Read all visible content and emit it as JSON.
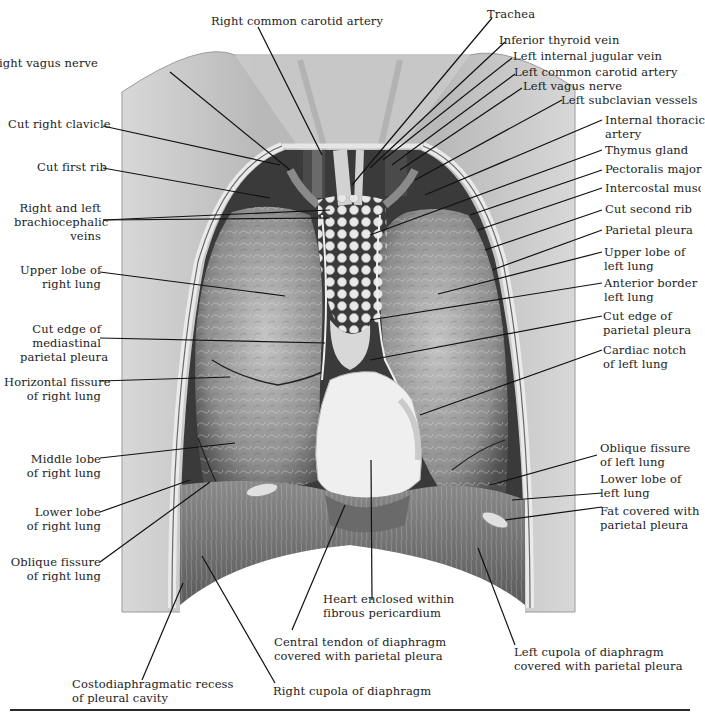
{
  "figure": {
    "style": "grayscale anatomical illustration"
  },
  "labels": {
    "right_common_carotid_artery": [
      "Right common carotid artery"
    ],
    "trachea": [
      "Trachea"
    ],
    "inferior_thyroid_vein": [
      "Inferior thyroid vein"
    ],
    "left_internal_jugular_vein": [
      "Left internal jugular vein"
    ],
    "left_common_carotid_artery": [
      "Left common carotid artery"
    ],
    "left_vagus_nerve": [
      "Left vagus nerve"
    ],
    "left_subclavian_vessels": [
      "Left subclavian vessels"
    ],
    "right_vagus_nerve": [
      "Right vagus nerve"
    ],
    "cut_right_clavicle": [
      "Cut right clavicle"
    ],
    "internal_thoracic_artery": [
      "Internal thoracic",
      "artery"
    ],
    "thymus_gland": [
      "Thymus gland"
    ],
    "cut_first_rib": [
      "Cut first rib"
    ],
    "pectoralis_major": [
      "Pectoralis major"
    ],
    "intercostal_muscle": [
      "Intercostal muscle"
    ],
    "brachiocephalic_veins": [
      "Right and left",
      "brachiocephalic",
      "veins"
    ],
    "cut_second_rib": [
      "Cut second rib"
    ],
    "parietal_pleura": [
      "Parietal pleura"
    ],
    "upper_lobe_right_lung": [
      "Upper lobe of",
      "right lung"
    ],
    "upper_lobe_left_lung": [
      "Upper lobe of",
      "left lung"
    ],
    "anterior_border_left_lung": [
      "Anterior border of",
      "left lung"
    ],
    "cut_edge_mediastinal_pleura": [
      "Cut edge of",
      "mediastinal",
      "parietal pleura"
    ],
    "cut_edge_parietal_pleura": [
      "Cut edge of",
      "parietal pleura"
    ],
    "cardiac_notch": [
      "Cardiac notch",
      "of left lung"
    ],
    "horizontal_fissure": [
      "Horizontal fissure",
      "of right lung"
    ],
    "middle_lobe_right_lung": [
      "Middle lobe",
      "of right lung"
    ],
    "oblique_fissure_left": [
      "Oblique fissure",
      "of left lung"
    ],
    "lower_lobe_left_lung": [
      "Lower lobe of",
      "left lung"
    ],
    "lower_lobe_right_lung": [
      "Lower lobe",
      "of right lung"
    ],
    "fat_parietal_pleura": [
      "Fat covered with",
      "parietal pleura"
    ],
    "oblique_fissure_right": [
      "Oblique fissure",
      "of right lung"
    ],
    "heart_pericardium": [
      "Heart enclosed within",
      "fibrous pericardium"
    ],
    "central_tendon": [
      "Central tendon of diaphragm",
      "covered with parietal pleura"
    ],
    "left_cupola": [
      "Left cupola of diaphragm",
      "covered with parietal pleura"
    ],
    "costodiaphragmatic_recess": [
      "Costodiaphragmatic recess",
      "of pleural cavity"
    ],
    "right_cupola": [
      "Right cupola of diaphragm"
    ]
  },
  "colors": {
    "skin": "#c9c9c9",
    "lung": "#9c9c9c",
    "lung_dark": "#5e5e5e",
    "thymus": "#dcdcdc",
    "heart": "#ececec",
    "diaphragm": "#7a7a7a",
    "vessel": "#3a3a3a",
    "leader": "#111111"
  }
}
